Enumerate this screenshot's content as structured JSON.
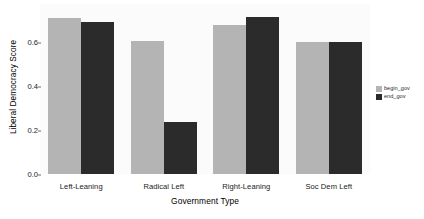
{
  "chart_data": {
    "type": "bar",
    "title": "",
    "xlabel": "Government Type",
    "ylabel": "Liberal Democracy Score",
    "categories": [
      "Left-Leaning",
      "Radical Left",
      "Right-Leaning",
      "Soc Dem Left"
    ],
    "series": [
      {
        "name": "begin_gov",
        "color": "#b4b4b4",
        "values": [
          0.71,
          0.605,
          0.68,
          0.6
        ]
      },
      {
        "name": "end_gov",
        "color": "#2b2b2b",
        "values": [
          0.69,
          0.235,
          0.715,
          0.6
        ]
      }
    ],
    "ylim": [
      0.0,
      0.7733
    ],
    "yticks": [
      0.0,
      0.2,
      0.4,
      0.6
    ],
    "ytick_labels": [
      "0.0",
      "0.2",
      "0.4",
      "0.6"
    ],
    "grid": false,
    "legend_position": "right",
    "legend_entries": [
      "begin_gov",
      "end_gov"
    ],
    "background_color": "#fbfbfb",
    "figure_background": "#ffffff"
  }
}
